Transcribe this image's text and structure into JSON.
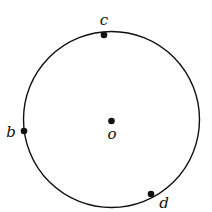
{
  "diagram": {
    "type": "circle-with-points",
    "circle": {
      "cx": 111.5,
      "cy": 119.5,
      "r": 88,
      "stroke": "#111111"
    },
    "center": {
      "label": "o",
      "x": 111.5,
      "y": 121
    },
    "points": [
      {
        "label": "c",
        "x": 104,
        "y": 35
      },
      {
        "label": "b",
        "x": 24,
        "y": 131
      },
      {
        "label": "d",
        "x": 151,
        "y": 194
      }
    ]
  }
}
